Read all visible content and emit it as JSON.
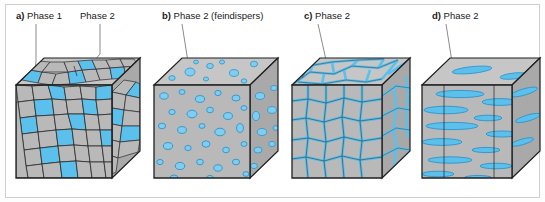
{
  "figure": {
    "background": "#ffffff",
    "frame_color": "#cfcfcf",
    "colors": {
      "matrix_gray": "#b9b9b9",
      "matrix_gray_top": "#c6c6c6",
      "matrix_gray_side": "#a9a9a9",
      "phase_blue": "#5cc0ec",
      "phase_blue_dark": "#2f93c8",
      "grain_outline": "#2b2b2b",
      "cube_edge": "#1f1f1f",
      "leader_line": "#5a5a5a",
      "text": "#1a1a1a"
    }
  },
  "panels": [
    {
      "id": "a",
      "tag": "a)",
      "labels": [
        {
          "text": "Phase 1",
          "points_to": "gray-grain"
        },
        {
          "text": "Phase 2",
          "points_to": "blue-grain"
        }
      ],
      "morphology": "polycrystalline two-phase grain structure",
      "description": "Equiaxed gray grains of Phase 1 with dispersed blue Phase 2 grains of similar size"
    },
    {
      "id": "b",
      "tag": "b)",
      "labels": [
        {
          "text": "Phase 2 (feindispers)",
          "points_to": "blue-particle"
        }
      ],
      "morphology": "finely dispersed particles",
      "description": "Small rounded blue Phase 2 particles finely dispersed in a gray matrix"
    },
    {
      "id": "c",
      "tag": "c)",
      "labels": [
        {
          "text": "Phase 2",
          "points_to": "blue-boundary-film"
        }
      ],
      "morphology": "continuous grain-boundary network",
      "description": "Blue Phase 2 forms a continuous film along the gray grain boundaries"
    },
    {
      "id": "d",
      "tag": "d)",
      "labels": [
        {
          "text": "Phase 2",
          "points_to": "blue-platelet"
        }
      ],
      "morphology": "aligned plate-like precipitates",
      "description": "Flat lens-shaped blue Phase 2 platelets aligned horizontally in a gray matrix"
    }
  ]
}
